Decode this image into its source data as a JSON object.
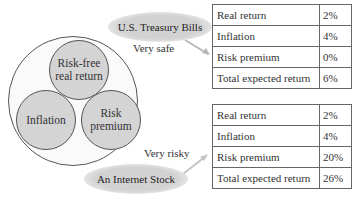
{
  "diagram": {
    "components": [
      {
        "id": "risk_free",
        "label": "Risk-free real return"
      },
      {
        "id": "inflation",
        "label": "Inflation"
      },
      {
        "id": "risk_premium",
        "label": "Risk premium"
      }
    ],
    "components_display": {
      "risk_free_line1": "Risk-free",
      "risk_free_line2": "real return",
      "inflation": "Inflation",
      "risk_premium_line1": "Risk",
      "risk_premium_line2": "premium"
    },
    "examples": [
      {
        "name": "U.S. Treasury Bills",
        "risk_label": "Very safe",
        "table": [
          {
            "label": "Real return",
            "value": "2%"
          },
          {
            "label": "Inflation",
            "value": "4%"
          },
          {
            "label": "Risk premium",
            "value": "0%"
          },
          {
            "label": "Total expected return",
            "value": "6%"
          }
        ]
      },
      {
        "name": "An Internet Stock",
        "risk_label": "Very risky",
        "table": [
          {
            "label": "Real return",
            "value": "2%"
          },
          {
            "label": "Inflation",
            "value": "4%"
          },
          {
            "label": "Risk premium",
            "value": "20%"
          },
          {
            "label": "Total expected return",
            "value": "26%"
          }
        ]
      }
    ]
  },
  "colors": {
    "circle_fill": "#d4d4d4",
    "ellipse_fill": "#d2d2d2",
    "border": "#555555"
  }
}
